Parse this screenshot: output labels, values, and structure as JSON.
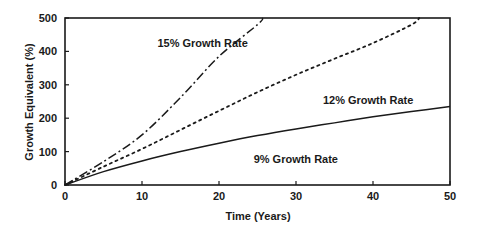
{
  "chart_data": {
    "type": "line",
    "title": "",
    "xlabel": "Time (Years)",
    "ylabel": "Growth Equivalent (%)",
    "xlim": [
      0,
      50
    ],
    "ylim": [
      0,
      500
    ],
    "xticks": [
      0,
      10,
      20,
      30,
      40,
      50
    ],
    "yticks": [
      0,
      100,
      200,
      300,
      400,
      500
    ],
    "grid": false,
    "legend": "none (inline curve annotations)",
    "series": [
      {
        "name": "9% Growth Rate",
        "style": "solid",
        "x": [
          0,
          5,
          10,
          15,
          20,
          25,
          30,
          35,
          40,
          45,
          50
        ],
        "y": [
          0,
          40,
          72,
          100,
          125,
          148,
          168,
          186,
          204,
          220,
          235
        ]
      },
      {
        "name": "12% Growth Rate",
        "style": "dotted",
        "x": [
          0,
          5,
          10,
          15,
          20,
          25,
          30,
          35,
          40,
          45,
          46
        ],
        "y": [
          0,
          55,
          108,
          165,
          222,
          278,
          330,
          378,
          425,
          480,
          500
        ]
      },
      {
        "name": "15% Growth Rate",
        "style": "dash-dot",
        "x": [
          0,
          5,
          10,
          15,
          20,
          25,
          25.7
        ],
        "y": [
          0,
          70,
          150,
          262,
          385,
          480,
          500
        ]
      }
    ],
    "annotations": [
      {
        "text": "15% Growth Rate",
        "x": 12,
        "y": 425
      },
      {
        "text": "12% Growth Rate",
        "x": 33.5,
        "y": 255
      },
      {
        "text": "9% Growth Rate",
        "x": 24.5,
        "y": 78
      }
    ]
  },
  "axes": {
    "x_title": "Time (Years)",
    "y_title": "Growth Equivalent (%)"
  }
}
